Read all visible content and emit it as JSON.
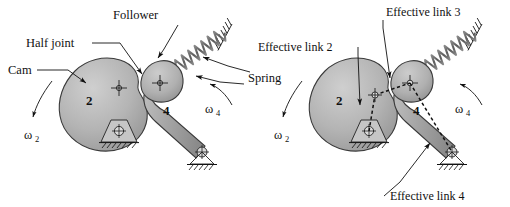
{
  "figure": {
    "panels": [
      {
        "id": "physical",
        "name": "cam-follower-physical",
        "labels": {
          "cam": "Cam",
          "half_joint": "Half joint",
          "follower": "Follower",
          "spring": "Spring",
          "link2_number": "2",
          "link4_number": "4",
          "omega2": "ω",
          "omega2_sub": "2",
          "omega4": "ω",
          "omega4_sub": "4"
        }
      },
      {
        "id": "effective",
        "name": "effective-linkage-equivalent",
        "labels": {
          "effective_link_2": "Effective link 2",
          "effective_link_3": "Effective link 3",
          "effective_link_4": "Effective link 4",
          "link2_number": "2",
          "link4_number": "4",
          "omega2": "ω",
          "omega2_sub": "2",
          "omega4": "ω",
          "omega4_sub": "4"
        }
      }
    ],
    "colors": {
      "background": "#ffffff",
      "body_fill_light": "#c9c9c9",
      "body_fill_mid": "#a8a8a8",
      "body_fill_dark": "#8f8f8f",
      "outline": "#3a3a3a",
      "ink": "#111111",
      "spring_gray": "#6e6e6e"
    },
    "geometry": {
      "cam_pivot_left": [
        118,
        131
      ],
      "cam_contact_left": [
        140,
        84
      ],
      "follower_center_left": [
        160,
        83
      ],
      "follower_pivot_left": [
        203,
        152
      ],
      "cam_pivot_right": [
        350,
        131
      ],
      "cam_point_right": [
        372,
        95
      ],
      "follower_center_right": [
        410,
        83
      ],
      "follower_pivot_right": [
        453,
        152
      ]
    }
  }
}
